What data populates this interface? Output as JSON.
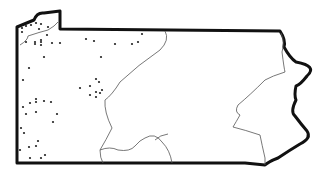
{
  "map": {
    "region": "Pennsylvania",
    "background": "#ffffff",
    "outline_color": "#111111",
    "inner_line_color": "#555555",
    "dot_color": "#222222",
    "dots": [
      [
        22,
        28
      ],
      [
        26,
        26
      ],
      [
        31,
        25
      ],
      [
        36,
        23
      ],
      [
        41,
        24
      ],
      [
        48,
        27
      ],
      [
        22,
        32
      ],
      [
        39,
        29
      ],
      [
        47,
        35
      ],
      [
        26,
        42
      ],
      [
        35,
        42
      ],
      [
        35,
        44
      ],
      [
        41,
        40
      ],
      [
        41,
        42
      ],
      [
        41,
        45
      ],
      [
        52,
        43
      ],
      [
        60,
        43
      ],
      [
        86,
        39
      ],
      [
        94,
        41
      ],
      [
        115,
        44
      ],
      [
        132,
        44
      ],
      [
        138,
        42
      ],
      [
        142,
        34
      ],
      [
        44,
        57
      ],
      [
        101,
        57
      ],
      [
        29,
        68
      ],
      [
        23,
        80
      ],
      [
        96,
        79
      ],
      [
        99,
        82
      ],
      [
        80,
        88
      ],
      [
        90,
        86
      ],
      [
        96,
        92
      ],
      [
        102,
        90
      ],
      [
        90,
        95
      ],
      [
        96,
        97
      ],
      [
        100,
        93
      ],
      [
        36,
        99
      ],
      [
        36,
        102
      ],
      [
        30,
        103
      ],
      [
        44,
        101
      ],
      [
        51,
        102
      ],
      [
        23,
        107
      ],
      [
        26,
        114
      ],
      [
        36,
        112
      ],
      [
        57,
        114
      ],
      [
        53,
        122
      ],
      [
        21,
        128
      ],
      [
        24,
        133
      ],
      [
        38,
        141
      ],
      [
        36,
        146
      ],
      [
        29,
        147
      ],
      [
        20,
        150
      ],
      [
        30,
        158
      ],
      [
        41,
        158
      ],
      [
        45,
        155
      ]
    ]
  }
}
